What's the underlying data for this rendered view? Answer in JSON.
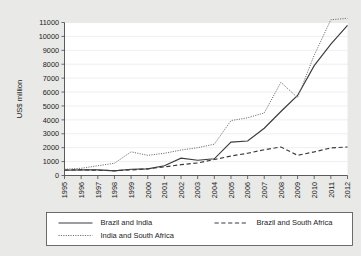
{
  "chart_data": {
    "type": "line",
    "title": "",
    "xlabel": "",
    "ylabel": "US$ million",
    "ylim": [
      0,
      11000
    ],
    "ytick_labels": [
      "0",
      "1000",
      "2000",
      "3000",
      "4000",
      "5000",
      "6000",
      "7000",
      "8000",
      "9000",
      "10000",
      "11000"
    ],
    "yticks": [
      0,
      1000,
      2000,
      3000,
      4000,
      5000,
      6000,
      7000,
      8000,
      9000,
      10000,
      11000
    ],
    "grid": true,
    "legend_position": "below-plot",
    "categories": [
      "1995",
      "1996",
      "1997",
      "1998",
      "1999",
      "2000",
      "2001",
      "2002",
      "2003",
      "2004",
      "2005",
      "2006",
      "2007",
      "2008",
      "2009",
      "2010",
      "2011",
      "2012"
    ],
    "x": [
      1995,
      1996,
      1997,
      1998,
      1999,
      2000,
      2001,
      2002,
      2003,
      2004,
      2005,
      2006,
      2007,
      2008,
      2009,
      2010,
      2011,
      2012
    ],
    "series": [
      {
        "name": "Brazil and India",
        "style": "solid",
        "values": [
          380,
          400,
          400,
          330,
          450,
          480,
          700,
          1250,
          1100,
          1200,
          2400,
          2480,
          3400,
          4600,
          5750,
          7900,
          9450,
          10800
        ]
      },
      {
        "name": "Brazil and South Africa",
        "style": "dashed",
        "values": [
          400,
          400,
          380,
          350,
          400,
          480,
          620,
          780,
          900,
          1150,
          1400,
          1600,
          1850,
          2050,
          1450,
          1700,
          1980,
          2050
        ]
      },
      {
        "name": "India and South Africa",
        "style": "dotted",
        "values": [
          450,
          520,
          700,
          880,
          1700,
          1450,
          1600,
          1830,
          2000,
          2250,
          3950,
          4150,
          4500,
          6700,
          5600,
          8650,
          11200,
          11300
        ]
      }
    ]
  },
  "legend": {
    "entries": [
      {
        "label": "Brazil and India",
        "style": "solid"
      },
      {
        "label": "Brazil and South Africa",
        "style": "dashed"
      },
      {
        "label": "India and South Africa",
        "style": "dotted"
      }
    ]
  }
}
